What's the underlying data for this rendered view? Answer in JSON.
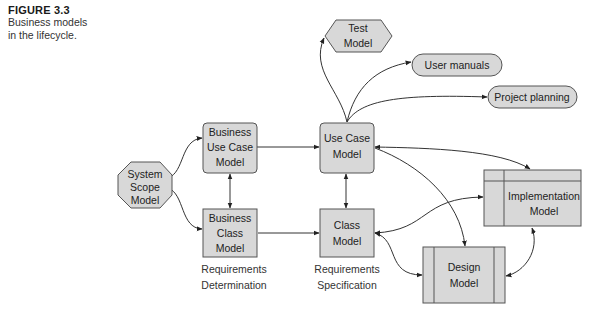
{
  "figure": {
    "number": "FIGURE 3.3",
    "caption_line1": "Business models",
    "caption_line2": "in the lifecycle."
  },
  "nodes": {
    "system_scope": {
      "shape": "octagon",
      "lines": [
        "System",
        "Scope",
        "Model"
      ]
    },
    "business_use_case": {
      "shape": "rounded-rect",
      "lines": [
        "Business",
        "Use Case",
        "Model"
      ]
    },
    "business_class": {
      "shape": "rect",
      "lines": [
        "Business",
        "Class",
        "Model"
      ]
    },
    "use_case": {
      "shape": "rounded-rect",
      "lines": [
        "Use Case",
        "Model"
      ]
    },
    "class_model": {
      "shape": "rect",
      "lines": [
        "Class",
        "Model"
      ]
    },
    "test_model": {
      "shape": "hexagon",
      "lines": [
        "Test",
        "Model"
      ]
    },
    "user_manuals": {
      "shape": "pill",
      "lines": [
        "User manuals"
      ]
    },
    "project_planning": {
      "shape": "pill",
      "lines": [
        "Project planning"
      ]
    },
    "implementation": {
      "shape": "table-rect",
      "lines": [
        "Implementation",
        "Model"
      ]
    },
    "design": {
      "shape": "double-bar-rect",
      "lines": [
        "Design",
        "Model"
      ]
    }
  },
  "phase_labels": {
    "determination": [
      "Requirements",
      "Determination"
    ],
    "specification": [
      "Requirements",
      "Specification"
    ]
  },
  "edges": [
    {
      "from": "System Scope Model",
      "to": "Business Use Case Model",
      "direction": "forward"
    },
    {
      "from": "System Scope Model",
      "to": "Business Class Model",
      "direction": "forward"
    },
    {
      "from": "Business Use Case Model",
      "to": "Business Class Model",
      "direction": "both"
    },
    {
      "from": "Business Use Case Model",
      "to": "Use Case Model",
      "direction": "forward"
    },
    {
      "from": "Business Class Model",
      "to": "Class Model",
      "direction": "forward"
    },
    {
      "from": "Use Case Model",
      "to": "Class Model",
      "direction": "both"
    },
    {
      "from": "Use Case Model",
      "to": "Test Model",
      "direction": "forward"
    },
    {
      "from": "Use Case Model",
      "to": "User manuals",
      "direction": "forward"
    },
    {
      "from": "Use Case Model",
      "to": "Project planning",
      "direction": "forward"
    },
    {
      "from": "Use Case Model",
      "to": "Implementation Model",
      "direction": "both"
    },
    {
      "from": "Use Case Model",
      "to": "Design Model",
      "direction": "forward"
    },
    {
      "from": "Class Model",
      "to": "Implementation Model",
      "direction": "both"
    },
    {
      "from": "Class Model",
      "to": "Design Model",
      "direction": "both"
    },
    {
      "from": "Design Model",
      "to": "Implementation Model",
      "direction": "both"
    }
  ],
  "colors": {
    "node_fill": "#d8d8d8",
    "node_stroke": "#555555",
    "edge": "#333333"
  }
}
